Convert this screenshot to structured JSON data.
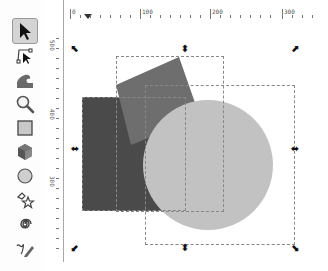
{
  "toolbox": {
    "tools": [
      {
        "name": "selector",
        "icon": "arrow-select-icon",
        "active": true
      },
      {
        "name": "node-editor",
        "icon": "node-edit-icon",
        "active": false
      },
      {
        "name": "tweak",
        "icon": "tweak-wave-icon",
        "active": false
      },
      {
        "name": "zoom",
        "icon": "magnifier-icon",
        "active": false
      },
      {
        "name": "rectangle",
        "icon": "rectangle-icon",
        "active": false
      },
      {
        "name": "3d-box",
        "icon": "3d-box-icon",
        "active": false
      },
      {
        "name": "ellipse",
        "icon": "circle-icon",
        "active": false
      },
      {
        "name": "star-polygon",
        "icon": "star-icon",
        "active": false
      },
      {
        "name": "spiral",
        "icon": "spiral-icon",
        "active": false
      },
      {
        "name": "pencil",
        "icon": "pencil-icon",
        "active": false
      }
    ]
  },
  "rulers": {
    "horizontal_labels": [
      "0",
      "100",
      "200",
      "300"
    ],
    "vertical_labels": [
      "500",
      "400",
      "300"
    ]
  },
  "canvas": {
    "shapes": [
      {
        "type": "rectangle",
        "color": "#4a4a4a"
      },
      {
        "type": "rotated-square",
        "color": "#6e6e6e"
      },
      {
        "type": "circle",
        "color": "#c2c2c2"
      }
    ],
    "selection_handles": [
      "scale-nw",
      "scale-n",
      "scale-ne",
      "scale-w",
      "scale-e",
      "scale-sw",
      "scale-s",
      "scale-se"
    ]
  }
}
